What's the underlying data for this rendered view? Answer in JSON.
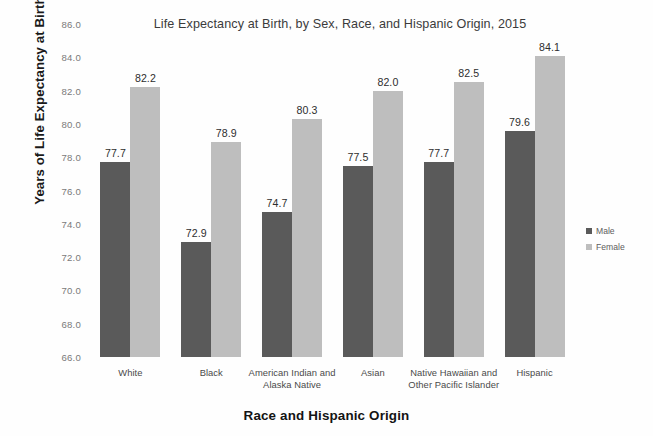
{
  "chart_data": {
    "type": "bar",
    "title": "Life Expectancy at Birth, by Sex, Race, and Hispanic Origin, 2015",
    "xlabel": "Race and Hispanic Origin",
    "ylabel": "Years of Life Expectancy at Birth",
    "ylim": [
      66.0,
      86.0
    ],
    "ytick_step": 2.0,
    "yticks": [
      "86.0",
      "84.0",
      "82.0",
      "80.0",
      "78.0",
      "76.0",
      "74.0",
      "72.0",
      "70.0",
      "68.0",
      "66.0"
    ],
    "grid": false,
    "legend_position": "right",
    "categories": [
      "White",
      "Black",
      "American Indian and Alaska Native",
      "Asian",
      "Native Hawaiian and Other Pacific Islander",
      "Hispanic"
    ],
    "series": [
      {
        "name": "Male",
        "color": "#5a5a5a",
        "values": [
          77.7,
          72.9,
          74.7,
          77.5,
          77.7,
          79.6
        ],
        "labels": [
          "77.7",
          "72.9",
          "74.7",
          "77.5",
          "77.7",
          "79.6"
        ]
      },
      {
        "name": "Female",
        "color": "#bebebe",
        "values": [
          82.2,
          78.9,
          80.3,
          82.0,
          82.5,
          84.1
        ],
        "labels": [
          "82.2",
          "78.9",
          "80.3",
          "82.0",
          "82.5",
          "84.1"
        ]
      }
    ]
  },
  "legend": {
    "items": [
      {
        "label": "Male",
        "color": "#5a5a5a"
      },
      {
        "label": "Female",
        "color": "#bebebe"
      }
    ]
  }
}
